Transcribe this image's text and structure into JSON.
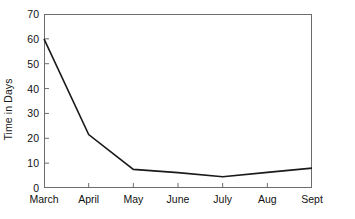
{
  "chart_data": {
    "type": "line",
    "title": "",
    "xlabel": "",
    "ylabel": "Time in Days",
    "categories": [
      "March",
      "April",
      "May",
      "June",
      "July",
      "Aug",
      "Sept"
    ],
    "values": [
      60,
      21.5,
      7.5,
      6.2,
      4.5,
      6.3,
      8
    ],
    "series": [
      {
        "name": "Time in Days",
        "values": [
          60,
          21.5,
          7.5,
          6.2,
          4.5,
          6.3,
          8
        ]
      }
    ],
    "ylim": [
      0,
      70
    ],
    "yticks": [
      0,
      10,
      20,
      30,
      40,
      50,
      60,
      70
    ],
    "ytick_labels": [
      "0",
      "10",
      "20",
      "30",
      "40",
      "50",
      "60",
      "70"
    ],
    "grid": false,
    "legend": "none",
    "line_color": "#1a1a1a",
    "frame_color": "#6d6d6d",
    "background_color": "#ffffff",
    "markers": false
  }
}
